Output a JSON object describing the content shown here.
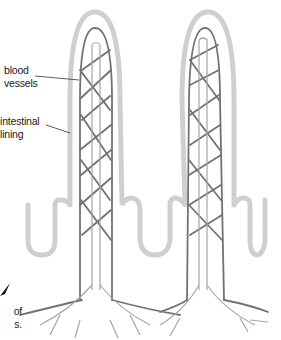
{
  "diagram": {
    "labels": {
      "blood_vessels": [
        "blood",
        "vessels"
      ],
      "intestinal_lining": [
        "intestinal",
        "lining"
      ],
      "partial_caption": [
        "of",
        "s."
      ]
    },
    "colors": {
      "vessel": "#707070",
      "lacteal": "#9a9a9a",
      "lining": "#c8c8c8",
      "text": "#1a1a1a",
      "background": "#ffffff"
    }
  }
}
